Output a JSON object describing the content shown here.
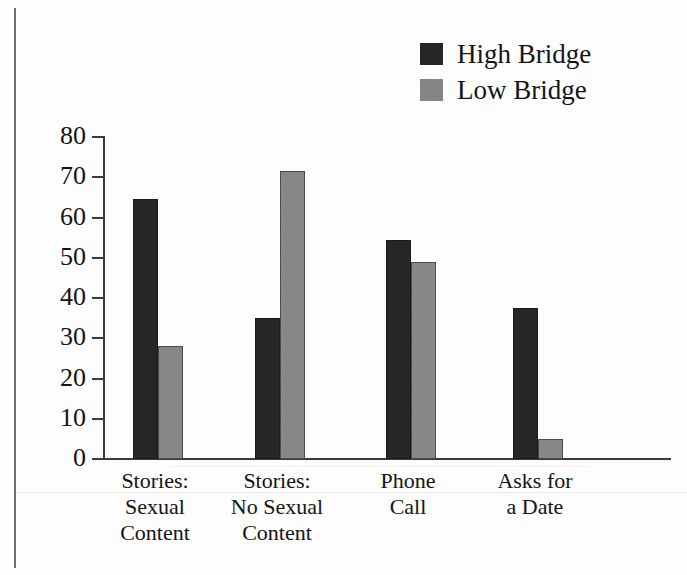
{
  "chart_data": {
    "type": "bar",
    "title": "",
    "xlabel": "",
    "ylabel": "",
    "ylim": [
      0,
      80
    ],
    "ytick_values": [
      80,
      70,
      60,
      50,
      40,
      30,
      20,
      10,
      0
    ],
    "ytick_labels": [
      "80",
      "70",
      "60",
      "50",
      "40",
      "30",
      "20",
      "10",
      "0"
    ],
    "grid": false,
    "legend_position": "top-right",
    "categories": [
      "Stories: Sexual Content",
      "Stories: No Sexual Content",
      "Phone Call",
      "Asks for a Date"
    ],
    "category_label_lines": [
      [
        "Stories:",
        "Sexual",
        "Content"
      ],
      [
        "Stories:",
        "No Sexual",
        "Content"
      ],
      [
        "Phone",
        "Call"
      ],
      [
        "Asks for",
        "a Date"
      ]
    ],
    "series": [
      {
        "name": "High Bridge",
        "color": "#262626",
        "values": [
          64.5,
          35,
          54.5,
          37.5
        ]
      },
      {
        "name": "Low Bridge",
        "color": "#8c8c8c",
        "values": [
          28,
          71.5,
          49,
          5
        ]
      }
    ]
  },
  "legend": {
    "items": [
      {
        "label": "High Bridge",
        "swatch": "dark"
      },
      {
        "label": "Low Bridge",
        "swatch": "gray"
      }
    ]
  },
  "colors": {
    "high_bridge": "#262626",
    "low_bridge": "#8c8c8c",
    "axis": "#3b3b3b",
    "text": "#141414",
    "background": "#fdfdfd"
  }
}
